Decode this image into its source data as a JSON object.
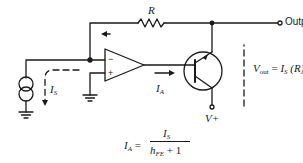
{
  "diagram": {
    "type": "transimpedance-amplifier-with-npn-boost-transistor",
    "colors": {
      "stroke": "#1a1a1a",
      "background": "#ffffff"
    },
    "labels": {
      "resistor": "R",
      "output": "Output",
      "source_current": "I",
      "source_current_sub": "S",
      "amp_current": "I",
      "amp_current_sub": "A",
      "supply": "V+",
      "opamp_inverting": "−",
      "opamp_noninverting": "+"
    },
    "equations": {
      "vout": {
        "lhs": "V",
        "lhs_sub": "out",
        "eq": " = ",
        "rhs": "I",
        "rhs_sub": "S",
        "rhs_tail": " (R)"
      },
      "ia": {
        "lhs": "I",
        "lhs_sub": "A",
        "eq": " = ",
        "num": "I",
        "num_sub": "S",
        "den_h": "h",
        "den_sub": "FE",
        "den_tail": " + 1"
      }
    },
    "components": [
      {
        "id": "current-source",
        "kind": "current source",
        "label_ref": "I_S"
      },
      {
        "id": "opamp",
        "kind": "operational amplifier"
      },
      {
        "id": "feedback-resistor",
        "kind": "resistor",
        "label": "R"
      },
      {
        "id": "npn-transistor",
        "kind": "NPN transistor"
      },
      {
        "id": "ground-1",
        "kind": "ground"
      },
      {
        "id": "ground-2",
        "kind": "ground"
      },
      {
        "id": "output-terminal",
        "kind": "terminal",
        "label": "Output"
      },
      {
        "id": "supply-terminal",
        "kind": "terminal",
        "label": "V+"
      }
    ]
  }
}
